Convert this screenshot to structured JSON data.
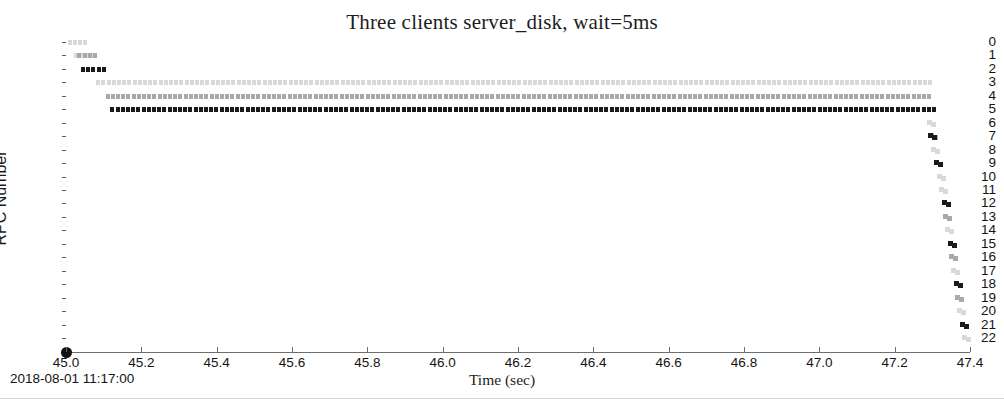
{
  "chart_data": {
    "type": "scatter",
    "title": "Three clients server_disk, wait=5ms",
    "xlabel": "Time (sec)",
    "ylabel": "RPC Number",
    "xlim": [
      45.0,
      47.4
    ],
    "ylim": [
      0,
      22
    ],
    "y_inverted": true,
    "grid": false,
    "legend": null,
    "x_ticks": [
      "45.0",
      "45.2",
      "45.4",
      "45.6",
      "45.8",
      "46.0",
      "46.2",
      "46.4",
      "46.6",
      "46.8",
      "47.0",
      "47.2",
      "47.4"
    ],
    "x_tick_values": [
      45.0,
      45.2,
      45.4,
      45.6,
      45.8,
      46.0,
      46.2,
      46.4,
      46.6,
      46.8,
      47.0,
      47.2,
      47.4
    ],
    "y_ticks": [
      "0",
      "1",
      "2",
      "3",
      "4",
      "5",
      "6",
      "7",
      "8",
      "9",
      "10",
      "11",
      "12",
      "13",
      "14",
      "15",
      "16",
      "17",
      "18",
      "19",
      "20",
      "21",
      "22"
    ],
    "y_tick_values": [
      0,
      1,
      2,
      3,
      4,
      5,
      6,
      7,
      8,
      9,
      10,
      11,
      12,
      13,
      14,
      15,
      16,
      17,
      18,
      19,
      20,
      21,
      22
    ],
    "series": [
      {
        "name": "client-1",
        "color": "#d9d9d9"
      },
      {
        "name": "client-2",
        "color": "#a9a9a9"
      },
      {
        "name": "client-3",
        "color": "#1a1a1a"
      }
    ],
    "segments": [
      {
        "rpc": 0,
        "series": 0,
        "color": "#d9d9d9",
        "x_start": 45.005,
        "x_end": 45.055
      },
      {
        "rpc": 1,
        "series": 0,
        "color": "#d9d9d9",
        "x_start": 45.02,
        "x_end": 45.075
      },
      {
        "rpc": 1,
        "series": 1,
        "color": "#a9a9a9",
        "x_start": 45.03,
        "x_end": 45.075
      },
      {
        "rpc": 2,
        "series": 2,
        "color": "#1a1a1a",
        "x_start": 45.04,
        "x_end": 45.105
      },
      {
        "rpc": 3,
        "series": 0,
        "color": "#d9d9d9",
        "x_start": 45.08,
        "x_end": 47.29
      },
      {
        "rpc": 4,
        "series": 1,
        "color": "#a9a9a9",
        "x_start": 45.105,
        "x_end": 47.29
      },
      {
        "rpc": 5,
        "series": 2,
        "color": "#1a1a1a",
        "x_start": 45.118,
        "x_end": 47.3
      }
    ],
    "tail_points": [
      {
        "rpc": 6,
        "series": 0,
        "color": "#d9d9d9",
        "x": 47.285
      },
      {
        "rpc": 7,
        "series": 1,
        "color": "#a9a9a9",
        "x": 47.292
      },
      {
        "rpc": 7,
        "series": 2,
        "color": "#1a1a1a",
        "x": 47.288
      },
      {
        "rpc": 8,
        "series": 0,
        "color": "#d9d9d9",
        "x": 47.297
      },
      {
        "rpc": 9,
        "series": 2,
        "color": "#1a1a1a",
        "x": 47.305
      },
      {
        "rpc": 10,
        "series": 0,
        "color": "#d9d9d9",
        "x": 47.312
      },
      {
        "rpc": 11,
        "series": 0,
        "color": "#d9d9d9",
        "x": 47.318
      },
      {
        "rpc": 12,
        "series": 2,
        "color": "#1a1a1a",
        "x": 47.325
      },
      {
        "rpc": 13,
        "series": 1,
        "color": "#a9a9a9",
        "x": 47.328
      },
      {
        "rpc": 14,
        "series": 0,
        "color": "#d9d9d9",
        "x": 47.333
      },
      {
        "rpc": 15,
        "series": 2,
        "color": "#1a1a1a",
        "x": 47.341
      },
      {
        "rpc": 16,
        "series": 1,
        "color": "#a9a9a9",
        "x": 47.345
      },
      {
        "rpc": 17,
        "series": 0,
        "color": "#d9d9d9",
        "x": 47.35
      },
      {
        "rpc": 18,
        "series": 2,
        "color": "#1a1a1a",
        "x": 47.357
      },
      {
        "rpc": 19,
        "series": 1,
        "color": "#a9a9a9",
        "x": 47.361
      },
      {
        "rpc": 20,
        "series": 0,
        "color": "#d9d9d9",
        "x": 47.366
      },
      {
        "rpc": 21,
        "series": 2,
        "color": "#1a1a1a",
        "x": 47.374
      },
      {
        "rpc": 22,
        "series": 0,
        "color": "#d9d9d9",
        "x": 47.38
      }
    ]
  },
  "footer": {
    "timestamp": "2018-08-01 11:17:00"
  }
}
